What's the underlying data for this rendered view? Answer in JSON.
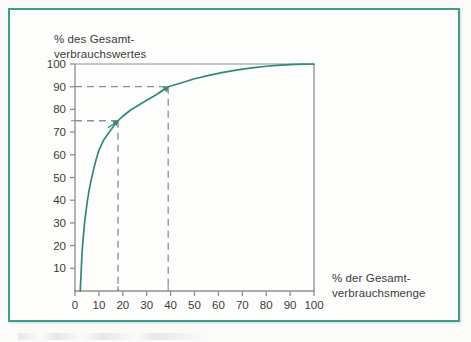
{
  "figure": {
    "background_color": "#fdfdfc",
    "border_color": "#3f9e8b"
  },
  "chart_data": {
    "type": "line",
    "title": "",
    "subtitle": "",
    "xlabel_line1": "% der Gesamt-",
    "xlabel_line2": "verbrauchsmenge",
    "ylabel_line1": "% des Gesamt-",
    "ylabel_line2": "verbrauchswertes",
    "xlim": [
      0,
      100
    ],
    "ylim": [
      0,
      100
    ],
    "xticks": [
      0,
      10,
      20,
      30,
      40,
      50,
      60,
      70,
      80,
      90,
      100
    ],
    "xticklabels": [
      "0",
      "10",
      "20",
      "30",
      "40",
      "50",
      "60",
      "70",
      "80",
      "90",
      "100"
    ],
    "yticks": [
      10,
      20,
      30,
      40,
      50,
      60,
      70,
      80,
      90,
      100
    ],
    "yticklabels": [
      "10",
      "20",
      "30",
      "40",
      "50",
      "60",
      "70",
      "80",
      "90",
      "100"
    ],
    "grid": false,
    "legend": "none",
    "series": [
      {
        "name": "Lorenzkurve",
        "color": "#2e8b7a",
        "x": [
          2.2,
          3,
          4,
          5,
          6,
          7,
          8,
          9,
          10,
          12,
          14,
          16,
          18,
          20,
          23,
          26,
          30,
          34,
          39,
          44,
          50,
          56,
          62,
          68,
          74,
          80,
          86,
          92,
          96,
          100
        ],
        "y": [
          0,
          18,
          30,
          38.5,
          45,
          50,
          54.5,
          58.5,
          62,
          66.5,
          69.5,
          72.5,
          75,
          77,
          79.5,
          81.5,
          84,
          86.5,
          90,
          91.5,
          93.5,
          95,
          96.3,
          97.4,
          98.3,
          99,
          99.5,
          99.85,
          99.95,
          100
        ]
      }
    ],
    "annotations": [
      {
        "name": "reference-75",
        "x": 18,
        "y": 75,
        "style": "dashed",
        "color": "#8c9090",
        "marker": "arrow",
        "marker_color": "#2e8b7a"
      },
      {
        "name": "reference-90",
        "x": 39,
        "y": 90,
        "style": "dashed",
        "color": "#8c9090",
        "marker": "arrow",
        "marker_color": "#2e8b7a"
      }
    ],
    "axis_color": "#8c9090",
    "tick_label_color": "#3b3b3b"
  }
}
